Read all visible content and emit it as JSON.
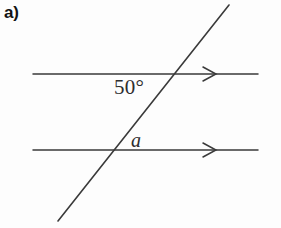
{
  "figure": {
    "part_label": "a)",
    "background_color": "#fdfdfd",
    "line_color": "#3a3a3a",
    "label_color": "#2e2e2e",
    "width": 281,
    "height": 228
  },
  "labels": {
    "angle_top": "50°",
    "angle_bottom": "a"
  },
  "diagram": {
    "type": "parallel-lines-transversal",
    "parallel_lines": [
      {
        "name": "top-parallel-line",
        "x1": 33,
        "y1": 74,
        "x2": 258,
        "y2": 74,
        "arrow_marker": "single-chevron",
        "arrow_x": 216
      },
      {
        "name": "bottom-parallel-line",
        "x1": 33,
        "y1": 150,
        "x2": 258,
        "y2": 150,
        "arrow_marker": "single-chevron",
        "arrow_x": 216
      }
    ],
    "transversal": {
      "name": "transversal-line",
      "x1": 229,
      "y1": 5,
      "x2": 58,
      "y2": 221
    },
    "intersections": [
      {
        "name": "top-intersection",
        "x": 173,
        "y": 74
      },
      {
        "name": "bottom-intersection",
        "x": 108,
        "y": 150
      }
    ]
  }
}
